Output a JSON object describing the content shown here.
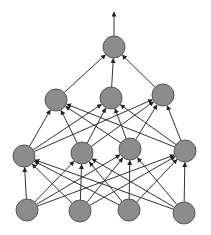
{
  "diagram": {
    "type": "feedforward-neural-network",
    "node_fill": "#8c8c8c",
    "node_stroke": "#555555",
    "edge_color": "#333333",
    "node_radius": 11,
    "layers": [
      {
        "name": "input",
        "nodes": [
          [
            27,
            210
          ],
          [
            80,
            211
          ],
          [
            129,
            210
          ],
          [
            184,
            213
          ]
        ]
      },
      {
        "name": "hidden-1",
        "nodes": [
          [
            24,
            156
          ],
          [
            82,
            153
          ],
          [
            130,
            149
          ],
          [
            185,
            151
          ]
        ]
      },
      {
        "name": "hidden-2",
        "nodes": [
          [
            56,
            100
          ],
          [
            111,
            98
          ],
          [
            163,
            95
          ]
        ]
      },
      {
        "name": "output",
        "nodes": [
          [
            114,
            47
          ]
        ]
      }
    ],
    "output_arrow": {
      "from": [
        114,
        36
      ],
      "to": [
        114,
        12
      ]
    }
  }
}
